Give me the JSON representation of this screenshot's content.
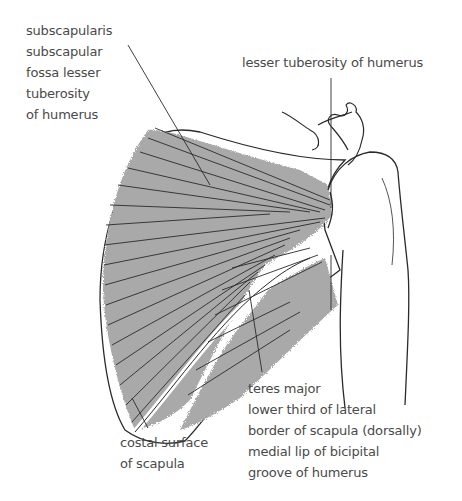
{
  "figure": {
    "colors": {
      "muscle_fill": "#a9a9a9",
      "outline": "#2a2a2a",
      "text": "#4a4a4a",
      "background": "#ffffff"
    }
  },
  "labels": {
    "subscapularis": {
      "lines": [
        "subscapularis",
        "subscapular",
        "fossa lesser",
        "tuberosity",
        "of humerus"
      ]
    },
    "lesser_tuberosity": {
      "lines": [
        "lesser tuberosity of humerus"
      ]
    },
    "teres_major": {
      "lines": [
        "teres major",
        "lower third of lateral",
        "border of scapula (dorsally)",
        "medial lip of bicipital",
        "groove of humerus"
      ]
    },
    "costal_surface": {
      "lines": [
        "costal surface",
        "of scapula"
      ]
    }
  }
}
